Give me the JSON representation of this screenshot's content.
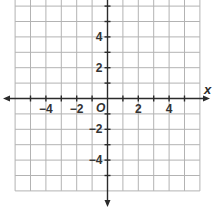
{
  "chart_data": {
    "type": "scatter",
    "title": "",
    "xlabel": "x",
    "ylabel": "",
    "origin_label": "O",
    "xlim": [
      -6,
      6
    ],
    "ylim": [
      -6,
      6
    ],
    "grid": true,
    "grid_step": 1,
    "x_ticks": [
      {
        "value": -4,
        "label": "−4"
      },
      {
        "value": -2,
        "label": "−2"
      },
      {
        "value": 2,
        "label": "2"
      },
      {
        "value": 4,
        "label": "4"
      }
    ],
    "y_ticks": [
      {
        "value": 4,
        "label": "4"
      },
      {
        "value": 2,
        "label": "2"
      },
      {
        "value": -2,
        "label": "−2"
      },
      {
        "value": -4,
        "label": "−4"
      }
    ],
    "points": [],
    "colors": {
      "grid": "#b3b3b3",
      "axis": "#2b2b2b",
      "label": "#333333"
    }
  }
}
